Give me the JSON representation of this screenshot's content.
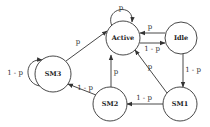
{
  "diagram": {
    "type": "state-transition",
    "nodes": [
      {
        "id": "active",
        "label": "Active",
        "cx": 123,
        "cy": 38,
        "r": 17
      },
      {
        "id": "idle",
        "label": "Idle",
        "cx": 181,
        "cy": 38,
        "r": 16
      },
      {
        "id": "sm3",
        "label": "SM3",
        "cx": 53,
        "cy": 74,
        "r": 18
      },
      {
        "id": "sm2",
        "label": "SM2",
        "cx": 110,
        "cy": 104,
        "r": 17
      },
      {
        "id": "sm1",
        "label": "SM1",
        "cx": 180,
        "cy": 104,
        "r": 17
      }
    ],
    "edges": [
      {
        "from": "active",
        "to": "active",
        "label": "p"
      },
      {
        "from": "idle",
        "to": "active",
        "label": "p"
      },
      {
        "from": "active",
        "to": "idle",
        "label": "1 - p"
      },
      {
        "from": "idle",
        "to": "sm1",
        "label": "1 - p"
      },
      {
        "from": "sm1",
        "to": "active",
        "label": "p"
      },
      {
        "from": "sm1",
        "to": "sm2",
        "label": "1 - p"
      },
      {
        "from": "sm2",
        "to": "active",
        "label": "p"
      },
      {
        "from": "sm2",
        "to": "sm3",
        "label": "1 - p"
      },
      {
        "from": "sm3",
        "to": "active",
        "label": "p"
      },
      {
        "from": "sm3",
        "to": "sm3",
        "label": "1 - p"
      }
    ]
  }
}
